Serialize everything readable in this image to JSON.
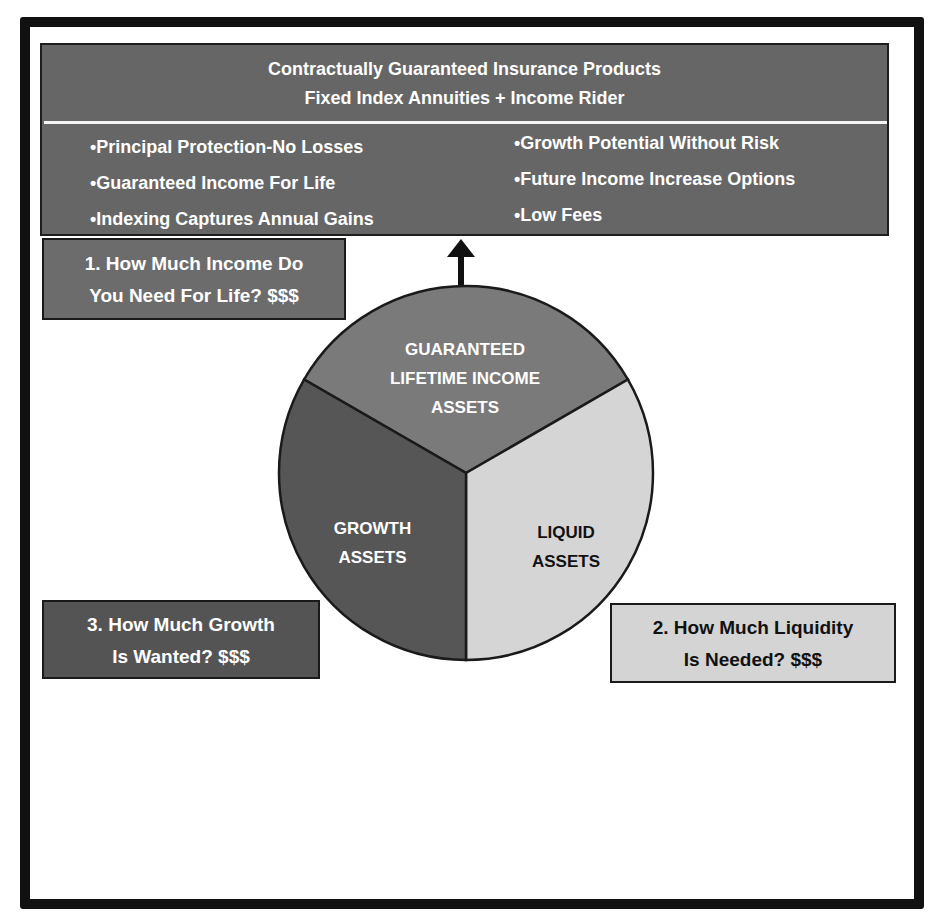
{
  "header": {
    "title_line1": "Contractually Guaranteed Insurance Products",
    "title_line2": "Fixed Index Annuities + Income Rider",
    "features_left": [
      "•Principal Protection-No Losses",
      "•Guaranteed Income For  Life",
      "•Indexing Captures Annual Gains"
    ],
    "features_right": [
      "•Growth Potential Without Risk",
      "•Future Income Increase Options",
      "•Low Fees"
    ]
  },
  "questions": {
    "income": {
      "line1": "1. How Much Income Do",
      "line2": "You Need For Life? $$$"
    },
    "liquidity": {
      "line1": "2. How Much Liquidity",
      "line2": "Is Needed? $$$"
    },
    "growth": {
      "line1": "3. How Much Growth",
      "line2": "Is Wanted? $$$"
    }
  },
  "pie": {
    "slices": [
      {
        "id": "guaranteed",
        "lines": [
          "GUARANTEED",
          "LIFETIME INCOME",
          "ASSETS"
        ],
        "color": "#7a7a7a",
        "text_color": "#ffffff"
      },
      {
        "id": "liquid",
        "lines": [
          "LIQUID",
          "ASSETS"
        ],
        "color": "#d5d5d5",
        "text_color": "#111111"
      },
      {
        "id": "growth",
        "lines": [
          "GROWTH",
          "ASSETS"
        ],
        "color": "#565656",
        "text_color": "#ffffff"
      }
    ],
    "arrow_icon": "arrow-up-icon"
  },
  "colors": {
    "frame": "#111111",
    "header_box": "#666666",
    "income_box": "#6c6c6c",
    "growth_box": "#545454",
    "liquidity_box": "#d4d4d4"
  }
}
